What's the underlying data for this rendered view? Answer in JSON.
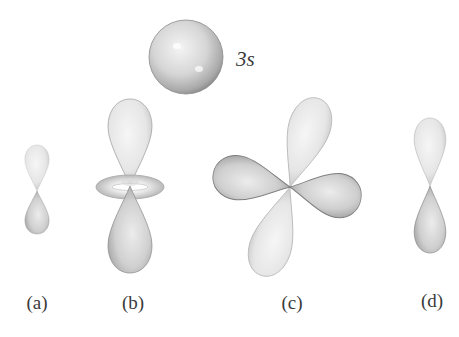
{
  "figure": {
    "sphere_label": "3s",
    "panels": [
      {
        "id": "a",
        "caption": "(a)"
      },
      {
        "id": "b",
        "caption": "(b)"
      },
      {
        "id": "c",
        "caption": "(c)"
      },
      {
        "id": "d",
        "caption": "(d)"
      }
    ],
    "colors": {
      "background": "#ffffff",
      "lobe_light": "#e9e9e9",
      "lobe_mid": "#cfcfcf",
      "lobe_dark": "#9a9a9a",
      "text": "#3a3a3a"
    }
  }
}
